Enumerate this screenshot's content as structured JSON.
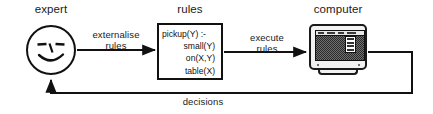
{
  "diagram": {
    "width": 433,
    "height": 114,
    "background": "#ffffff",
    "stroke_color": "#111111",
    "nodes": [
      {
        "id": "expert",
        "label": "expert",
        "icon": "smiley-face-icon"
      },
      {
        "id": "rules",
        "label": "rules",
        "icon": "rules-box"
      },
      {
        "id": "computer",
        "label": "computer",
        "icon": "computer-monitor-icon"
      }
    ],
    "rules_code": [
      {
        "text": "pickup(Y) :-",
        "indent": false
      },
      {
        "text": "small(Y)",
        "indent": true
      },
      {
        "text": "on(X,Y)",
        "indent": true
      },
      {
        "text": "table(X)",
        "indent": true
      }
    ],
    "edges": [
      {
        "id": "expert-to-rules",
        "from": "expert",
        "to": "rules",
        "line1": "externalise",
        "line2": "rules"
      },
      {
        "id": "rules-to-computer",
        "from": "rules",
        "to": "computer",
        "line1": "execute",
        "line2": "rules"
      },
      {
        "id": "computer-to-expert",
        "from": "computer",
        "to": "expert",
        "line1": "decisions",
        "line2": ""
      }
    ]
  }
}
